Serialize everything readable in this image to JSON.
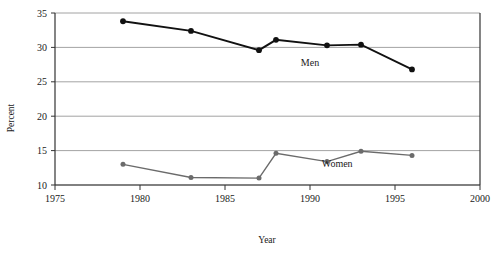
{
  "chart_data": {
    "type": "line",
    "title": "",
    "xlabel": "Year",
    "ylabel": "Percent",
    "xlim": [
      1975,
      2000
    ],
    "ylim": [
      10,
      35
    ],
    "xticks": [
      1975,
      1980,
      1985,
      1990,
      1995,
      2000
    ],
    "yticks": [
      10,
      15,
      20,
      25,
      30,
      35
    ],
    "xtick_labels": [
      "1975",
      "1980",
      "1985",
      "1990",
      "1995",
      "2000"
    ],
    "ytick_labels": [
      "10",
      "15",
      "20",
      "25",
      "30",
      "35"
    ],
    "grid": "horizontal",
    "legend_position": "inline-annotations",
    "series": [
      {
        "name": "Men",
        "color": "#111111",
        "marker": "filled-circle",
        "label_x": 1990.0,
        "label_y": 27.3,
        "x": [
          1979,
          1983,
          1987,
          1988,
          1991,
          1993,
          1996
        ],
        "values": [
          33.8,
          32.4,
          29.6,
          31.1,
          30.3,
          30.4,
          26.8
        ]
      },
      {
        "name": "Women",
        "color": "#6b6b6b",
        "marker": "filled-circle",
        "label_x": 1991.6,
        "label_y": 12.6,
        "x": [
          1979,
          1983,
          1987,
          1988,
          1991,
          1993,
          1996
        ],
        "values": [
          13.0,
          11.1,
          11.0,
          14.6,
          13.4,
          14.9,
          14.3
        ]
      }
    ]
  },
  "axes": {
    "y_title": "Percent",
    "x_title": "Year"
  },
  "colors": {
    "men_series": "#111111",
    "women_series": "#6b6b6b",
    "gridline": "#8c8c8c",
    "axis": "#333333",
    "background": "#ffffff"
  }
}
